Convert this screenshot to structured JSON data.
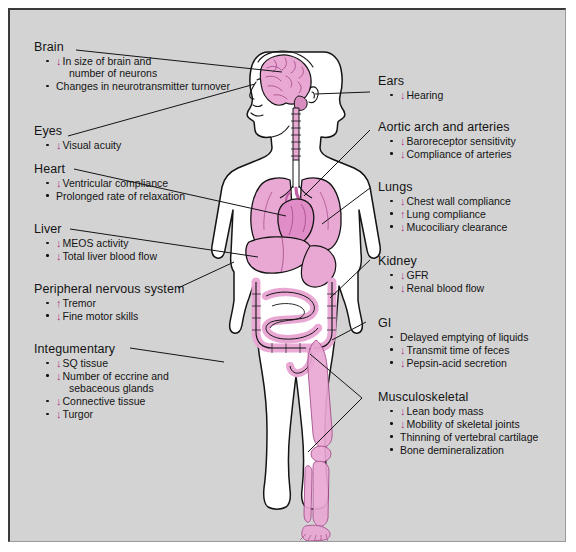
{
  "diagram": {
    "colors": {
      "panel_background": "#d3d3d3",
      "organ_pink": "#e9a8d4",
      "arrow_magenta": "#b0338c",
      "outline_black": "#141414",
      "page_white": "#ffffff"
    },
    "arrows": {
      "decrease": "↓",
      "increase": "↑"
    }
  },
  "left_column": [
    {
      "id": "brain",
      "label": "Brain",
      "items": [
        {
          "arrow": "↓",
          "text": "In size of brain and",
          "cont": "number of neurons"
        },
        {
          "arrow": "",
          "text": "Changes in neurotransmitter turnover"
        }
      ]
    },
    {
      "id": "eyes",
      "label": "Eyes",
      "items": [
        {
          "arrow": "↓",
          "text": "Visual acuity"
        }
      ]
    },
    {
      "id": "heart",
      "label": "Heart",
      "items": [
        {
          "arrow": "↓",
          "text": "Ventricular compliance"
        },
        {
          "arrow": "",
          "text": "Prolonged rate of relaxation"
        }
      ]
    },
    {
      "id": "liver",
      "label": "Liver",
      "items": [
        {
          "arrow": "↓",
          "text": "MEOS activity"
        },
        {
          "arrow": "↓",
          "text": "Total liver blood flow"
        }
      ]
    },
    {
      "id": "peripheral-nervous-system",
      "label": "Peripheral nervous system",
      "items": [
        {
          "arrow": "↑",
          "text": "Tremor"
        },
        {
          "arrow": "↓",
          "text": "Fine motor skills"
        }
      ]
    },
    {
      "id": "integumentary",
      "label": "Integumentary",
      "items": [
        {
          "arrow": "↓",
          "text": "SQ tissue"
        },
        {
          "arrow": "↓",
          "text": "Number of eccrine and",
          "cont": "sebaceous glands"
        },
        {
          "arrow": "↓",
          "text": "Connective tissue"
        },
        {
          "arrow": "↓",
          "text": "Turgor"
        }
      ]
    }
  ],
  "right_column": [
    {
      "id": "ears",
      "label": "Ears",
      "items": [
        {
          "arrow": "↓",
          "text": "Hearing"
        }
      ]
    },
    {
      "id": "aortic-arch-and-arteries",
      "label": "Aortic arch and arteries",
      "items": [
        {
          "arrow": "↓",
          "text": "Baroreceptor sensitivity"
        },
        {
          "arrow": "↓",
          "text": "Compliance of arteries"
        }
      ]
    },
    {
      "id": "lungs",
      "label": "Lungs",
      "items": [
        {
          "arrow": "↓",
          "text": "Chest wall compliance"
        },
        {
          "arrow": "↑",
          "text": "Lung compliance"
        },
        {
          "arrow": "↓",
          "text": "Mucociliary clearance"
        }
      ]
    },
    {
      "id": "kidney",
      "label": "Kidney",
      "items": [
        {
          "arrow": "↓",
          "text": "GFR"
        },
        {
          "arrow": "↓",
          "text": "Renal blood flow"
        }
      ]
    },
    {
      "id": "gi",
      "label": "GI",
      "items": [
        {
          "arrow": "",
          "text": "Delayed emptying of liquids"
        },
        {
          "arrow": "↓",
          "text": "Transmit time of feces"
        },
        {
          "arrow": "↓",
          "text": "Pepsin-acid secretion"
        }
      ]
    },
    {
      "id": "musculoskeletal",
      "label": "Musculoskeletal",
      "items": [
        {
          "arrow": "↓",
          "text": "Lean body mass"
        },
        {
          "arrow": "↓",
          "text": "Mobility of skeletal joints"
        },
        {
          "arrow": "",
          "text": "Thinning of vertebral cartilage"
        },
        {
          "arrow": "",
          "text": "Bone demineralization"
        }
      ]
    }
  ]
}
